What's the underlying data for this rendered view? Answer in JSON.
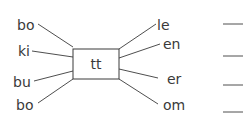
{
  "diagram": {
    "center": {
      "label": "tt"
    },
    "left_prefixes": [
      {
        "label": "bo"
      },
      {
        "label": "ki"
      },
      {
        "label": "bu"
      },
      {
        "label": "bo"
      }
    ],
    "right_suffixes": [
      {
        "label": "le"
      },
      {
        "label": "en"
      },
      {
        "label": "er"
      },
      {
        "label": "om"
      }
    ],
    "answer_blanks": 4,
    "colors": {
      "ink": "#3a3a3a",
      "background": "#ffffff"
    }
  }
}
